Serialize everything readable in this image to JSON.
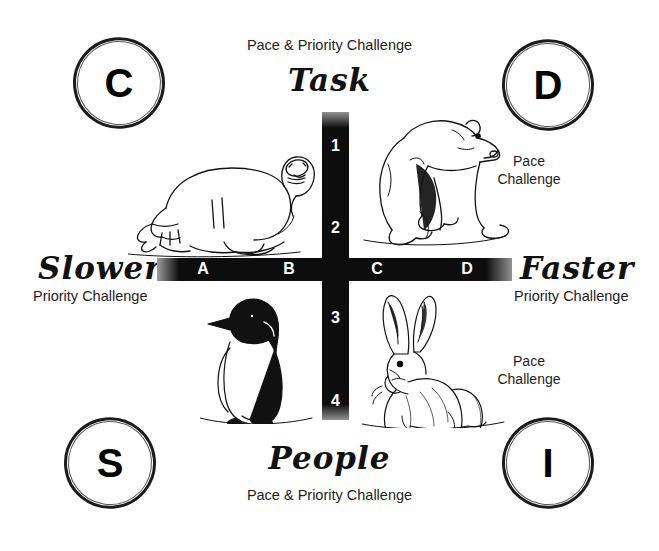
{
  "diagram": {
    "title_top_sub": "Pace & Priority Challenge",
    "title_top": "Task",
    "title_bottom": "People",
    "title_bottom_sub": "Pace & Priority Challenge",
    "left_axis_label": "Slower",
    "left_axis_sub": "Priority Challenge",
    "right_axis_label": "Faster",
    "right_axis_sub": "Priority Challenge",
    "vertical_ticks": [
      "1",
      "2",
      "3",
      "4"
    ],
    "horizontal_ticks": [
      "A",
      "B",
      "C",
      "D"
    ],
    "badges": [
      {
        "letter": "C",
        "quadrant": "top-left"
      },
      {
        "letter": "D",
        "quadrant": "top-right"
      },
      {
        "letter": "S",
        "quadrant": "bottom-left"
      },
      {
        "letter": "I",
        "quadrant": "bottom-right"
      }
    ],
    "quadrant_notes": [
      {
        "id": "d-note",
        "line1": "Pace",
        "line2": "Challenge"
      },
      {
        "id": "i-note",
        "line1": "Pace",
        "line2": "Challenge"
      }
    ],
    "animals": [
      {
        "id": "seal-illustration",
        "name": "seal",
        "quadrant": "C"
      },
      {
        "id": "polar-bear-illustration",
        "name": "polar-bear",
        "quadrant": "D"
      },
      {
        "id": "penguin-illustration",
        "name": "penguin",
        "quadrant": "S"
      },
      {
        "id": "hare-illustration",
        "name": "hare",
        "quadrant": "I"
      }
    ],
    "colors": {
      "ink": "#0d0d0d",
      "background": "#ffffff",
      "tick_text": "#ffffff"
    }
  }
}
